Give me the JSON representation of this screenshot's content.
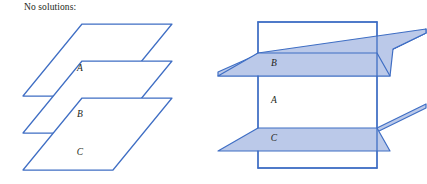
{
  "figure": {
    "caption": "No solutions:",
    "width": 427,
    "height": 184,
    "background_color": "#ffffff",
    "stroke_color": "#3f6ec4",
    "fill_color": "#bbc9e9",
    "label_color": "#231f20"
  },
  "left_diagram": {
    "name": "three-parallel-planes",
    "description": "Three parallel planes stacked vertically, no common intersection",
    "planes": [
      {
        "label": "A",
        "label_x": 80,
        "label_y": 71,
        "shaded": false
      },
      {
        "label": "B",
        "label_x": 80,
        "label_y": 117,
        "shaded": false
      },
      {
        "label": "C",
        "label_x": 80,
        "label_y": 155,
        "shaded": false
      }
    ]
  },
  "right_diagram": {
    "name": "vertical-plane-with-two-parallel-cutting-planes",
    "description": "Vertical plane A intersected by two parallel horizontal planes B and C",
    "planes": [
      {
        "label": "B",
        "label_x": 61,
        "label_y": 63,
        "shaded": true
      },
      {
        "label": "A",
        "label_x": 61,
        "label_y": 100,
        "shaded": false
      },
      {
        "label": "C",
        "label_x": 61,
        "label_y": 138,
        "shaded": true
      }
    ]
  }
}
